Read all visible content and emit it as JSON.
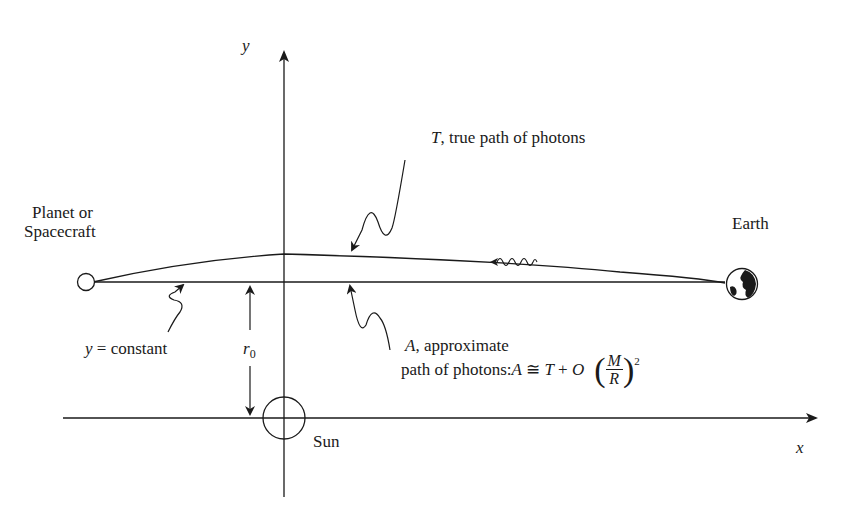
{
  "diagram": {
    "type": "light-deflection-geometry",
    "axes": {
      "x_label": "x",
      "y_label": "y"
    },
    "bodies": {
      "planet": {
        "label_line1": "Planet or",
        "label_line2": "Spacecraft"
      },
      "earth": {
        "label": "Earth"
      },
      "sun": {
        "label": "Sun"
      }
    },
    "labels": {
      "true_path_var": "T",
      "true_path_text": ", true path of photons",
      "y_constant_var": "y",
      "y_constant_text": " = constant",
      "r0_var": "r",
      "r0_sub": "0",
      "approx_var": "A",
      "approx_line1_text": ", approximate",
      "approx_line2_text": "path of photons: ",
      "eq_A": "A",
      "eq_cong": " ≅ ",
      "eq_T": "T",
      "eq_plus": " + ",
      "eq_O": "O",
      "eq_num": "M",
      "eq_den": "R",
      "eq_exp": "2",
      "paren_open": "(",
      "paren_close": ")"
    },
    "colors": {
      "stroke": "#1a1a1a",
      "background": "#ffffff"
    }
  }
}
